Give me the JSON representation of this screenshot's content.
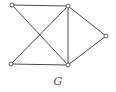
{
  "graph": {
    "label": "G",
    "nodes": [
      {
        "id": "a",
        "x": 12,
        "y": 5
      },
      {
        "id": "b",
        "x": 68,
        "y": 6
      },
      {
        "id": "c",
        "x": 106,
        "y": 36
      },
      {
        "id": "d",
        "x": 11,
        "y": 64
      },
      {
        "id": "e",
        "x": 68,
        "y": 65
      }
    ],
    "edges": [
      [
        "a",
        "b"
      ],
      [
        "a",
        "e"
      ],
      [
        "d",
        "b"
      ],
      [
        "d",
        "e"
      ],
      [
        "b",
        "e"
      ],
      [
        "b",
        "c"
      ],
      [
        "e",
        "c"
      ]
    ],
    "colors": {
      "stroke": "#4a4a4a",
      "node_fill": "#ffffff"
    }
  }
}
